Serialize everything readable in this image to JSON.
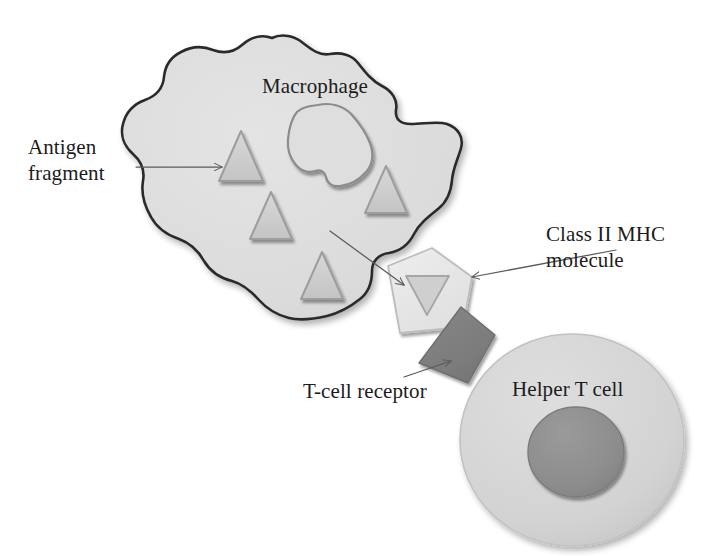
{
  "figure": {
    "background_color": "#ffffff"
  },
  "labels": {
    "antigen_fragment": "Antigen\nfragment",
    "macrophage": "Macrophage",
    "class_ii_mhc": "Class II MHC\nmolecule",
    "tcell_receptor": "T-cell receptor",
    "helper_t_cell": "Helper T cell"
  },
  "colors": {
    "cell_fill": "#dcdcdc",
    "cell_outline": "#2b2b2b",
    "nucleus_outline": "#8c8c8c",
    "nucleus_fill": "#dedede",
    "antigen_fill": "#cfcfcf",
    "antigen_outline": "#9a9a9a",
    "mhc_fill": "#e8e8e8",
    "mhc_outline": "#b8b8b8",
    "receptor_fill": "#808080",
    "receptor_outline": "#6e6e6e",
    "tcell_fill": "#d5d5d5",
    "tcell_outline": "#bdbdbd",
    "tcell_nucleus_fill": "#8e8e8e",
    "tcell_nucleus_outline": "#7e7e7e",
    "leader_line": "#5a5a5a",
    "text": "#1c1c1c"
  },
  "elements": {
    "macrophage": {
      "name": "Macrophage",
      "shape": "amoeboid blob",
      "has_nucleus": true,
      "antigen_fragment_count": 4
    },
    "antigen_fragments": [
      {
        "id": 1,
        "shape": "triangle-up",
        "cx": 241,
        "cy": 157
      },
      {
        "id": 2,
        "shape": "triangle-up",
        "cx": 386,
        "cy": 191
      },
      {
        "id": 3,
        "shape": "triangle-up",
        "cx": 271,
        "cy": 217
      },
      {
        "id": 4,
        "shape": "triangle-up",
        "cx": 322,
        "cy": 277
      },
      {
        "id": 5,
        "shape": "triangle-down",
        "cx": 427,
        "cy": 295,
        "location": "class-ii-mhc-groove"
      }
    ],
    "class_ii_mhc": {
      "name": "Class II MHC molecule",
      "shape": "pentagon",
      "holds_antigen_fragment": true
    },
    "tcell_receptor": {
      "name": "T-cell receptor",
      "shape": "rotated quadrilateral"
    },
    "helper_t_cell": {
      "name": "Helper T cell",
      "shape": "circle",
      "has_nucleus": true
    }
  },
  "annotations": [
    {
      "label": "Antigen fragment",
      "points_to": "antigen fragment inside macrophage",
      "direction": "left-to-right"
    },
    {
      "label": "Class II MHC molecule",
      "points_to": "MHC pentagon on macrophage surface",
      "direction": "right-to-left"
    },
    {
      "label": "T-cell receptor",
      "points_to": "dark receptor wedge",
      "direction": "left-to-right"
    },
    {
      "label": "(unlabeled)",
      "points_to": "MHC molecule from macrophage interior",
      "direction": "diagonal down-right"
    }
  ]
}
